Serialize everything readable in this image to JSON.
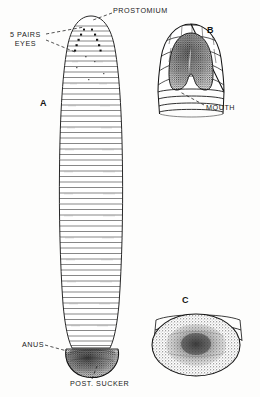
{
  "figure": {
    "caption_style": "scientific line drawing",
    "background_color": "#fdfdfc",
    "ink_color": "#1a1a1a"
  },
  "panels": [
    {
      "id": "A",
      "label": "A",
      "description": "whole leech, dorsal view, elongated segmented body with posterior sucker",
      "x": 42,
      "y": 101
    },
    {
      "id": "B",
      "label": "B",
      "description": "enlarged anterior end showing prostomium and mouth",
      "x": 208,
      "y": 27
    },
    {
      "id": "C",
      "label": "C",
      "description": "enlarged posterior sucker, ventral view",
      "x": 183,
      "y": 297
    }
  ],
  "annotations": [
    {
      "name": "prostomium",
      "text": "PROSTOMIUM",
      "x": 113,
      "y": 8,
      "leader": true
    },
    {
      "name": "five-pairs-eyes",
      "line1": "5 PAIRS",
      "line2": "EYES",
      "x": 12,
      "y": 31,
      "leader": true
    },
    {
      "name": "mouth",
      "text": "MOUTH",
      "x": 206,
      "y": 104,
      "leader": true
    },
    {
      "name": "anus",
      "text": "ANUS",
      "x": 22,
      "y": 341,
      "leader": true
    },
    {
      "name": "posterior-sucker",
      "text": "POST. SUCKER",
      "x": 70,
      "y": 380,
      "leader": true
    }
  ],
  "anatomy": {
    "body_segments_count": 58,
    "eye_spot_count": 10,
    "sucker_shading": "stipple",
    "prostomium_shading": "dense stipple"
  }
}
